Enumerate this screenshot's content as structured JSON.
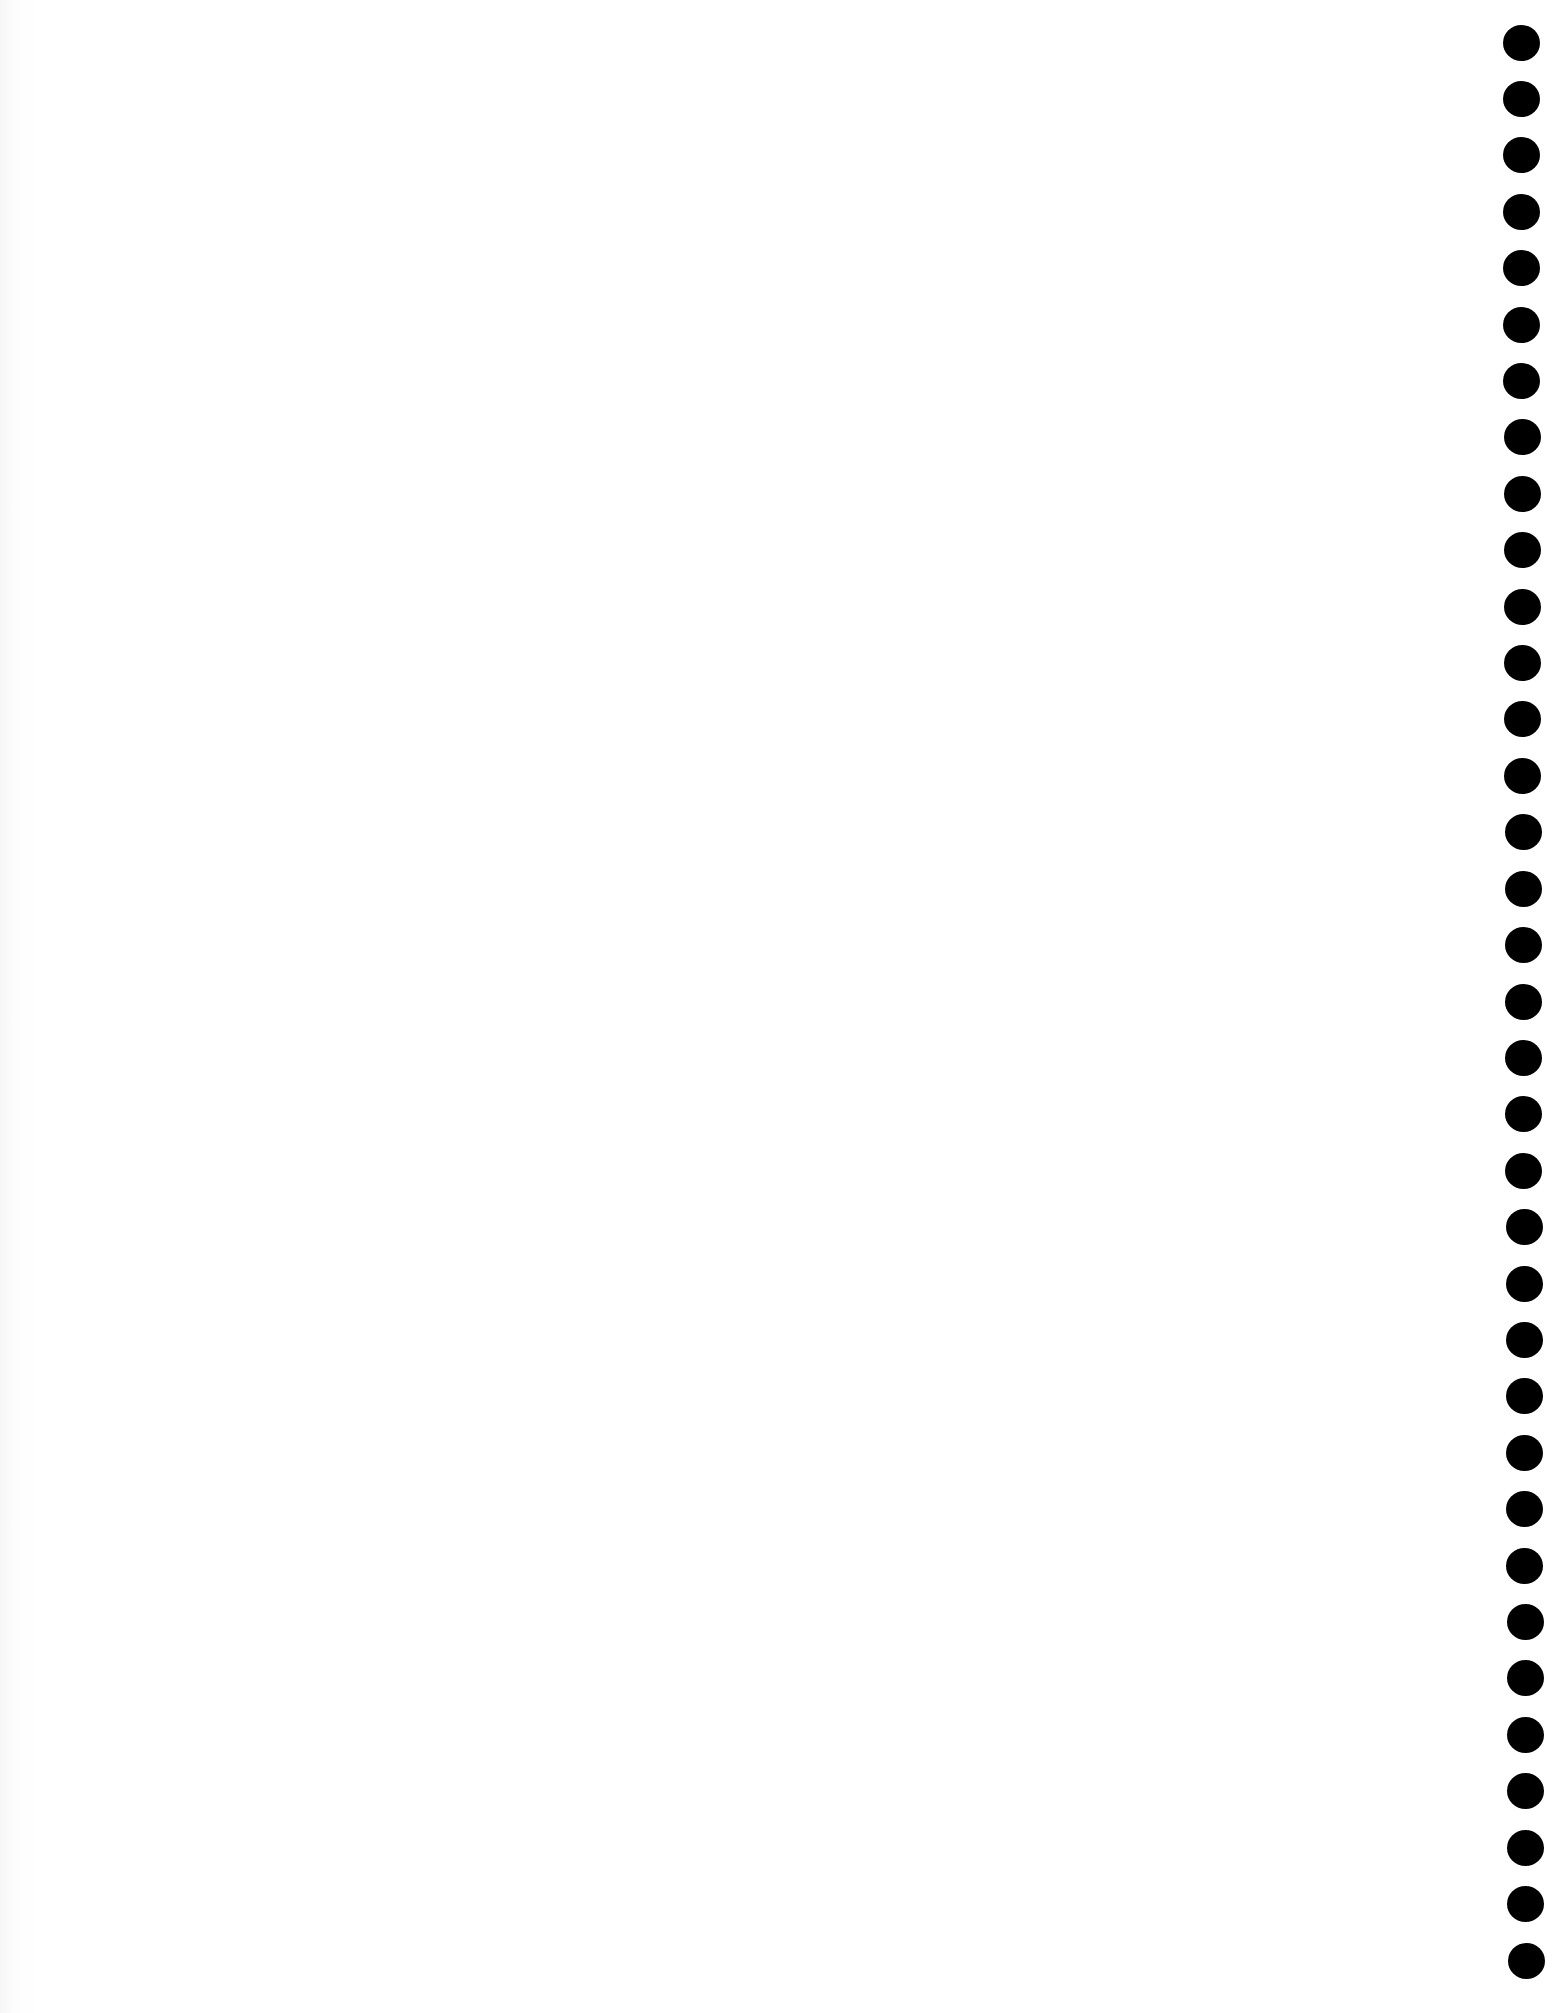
{
  "document": {
    "type": "scanned-blank-page",
    "background_color": "#ffffff",
    "text_content": ""
  },
  "punch_holes": {
    "count": 35,
    "color": "#000000",
    "diameter_px": 37,
    "first_center": [
      1521,
      43
    ],
    "last_center": [
      1526,
      1961
    ],
    "spacing_px": 56.4
  }
}
